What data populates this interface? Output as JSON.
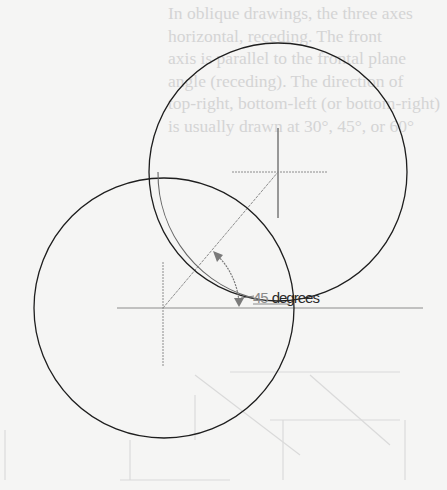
{
  "diagram": {
    "angle_label": {
      "number": "45",
      "unit": "degrees"
    },
    "angle_value_deg": 45,
    "circles": [
      {
        "name": "front-circle",
        "cx": 164,
        "cy": 308,
        "r": 130
      },
      {
        "name": "back-circle",
        "cx": 278,
        "cy": 172,
        "r": 129
      }
    ],
    "centerlines": {
      "front": {
        "cx": 164,
        "cy": 308
      },
      "back": {
        "cx": 278,
        "cy": 172
      }
    },
    "colors": {
      "outline": "#1e1e1e",
      "centerline": "#8c8c8c",
      "bleed_through": "#d4d4d4",
      "paper": "#f5f5f4"
    }
  },
  "bleed_through_text": {
    "lines": [
      "In oblique drawings, the three axes",
      "horizontal, receding. The front",
      "axis is parallel to the frontal plane",
      "angle (receding). The direction of",
      "top-right, bottom-left (or bottom-right)",
      "is usually drawn at 30°, 45°, or 60°"
    ]
  }
}
